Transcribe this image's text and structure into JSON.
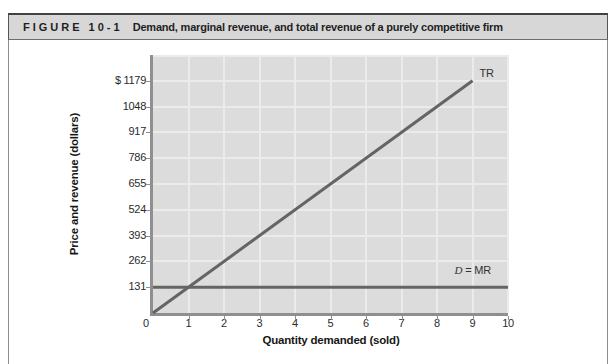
{
  "figure": {
    "label": "FIGURE 10-1",
    "title": "Demand, marginal revenue, and total revenue of a purely competitive firm"
  },
  "chart_data": {
    "type": "line",
    "title": "",
    "xlabel": "Quantity demanded (sold)",
    "ylabel": "Price and revenue (dollars)",
    "xlim": [
      0,
      10
    ],
    "ylim": [
      0,
      1310
    ],
    "grid": true,
    "plot_bg": "#dcdcdc",
    "x_ticks": [
      0,
      1,
      2,
      3,
      4,
      5,
      6,
      7,
      8,
      9,
      10
    ],
    "x_tick_labels": [
      "0",
      "1",
      "2",
      "3",
      "4",
      "5",
      "6",
      "7",
      "8",
      "9",
      "10"
    ],
    "y_ticks": [
      0,
      131,
      262,
      393,
      524,
      655,
      786,
      917,
      1048,
      1179
    ],
    "y_tick_labels": [
      "0",
      "131",
      "262",
      "393",
      "524",
      "655",
      "786",
      "917",
      "1048",
      "$ 1179"
    ],
    "series": [
      {
        "name": "TR",
        "points": [
          [
            0,
            0
          ],
          [
            9,
            1179
          ]
        ],
        "color": "#646464",
        "label_parts": [
          {
            "text": "TR",
            "italic": false
          }
        ],
        "label_anchor": "line-end"
      },
      {
        "name": "D = MR",
        "points": [
          [
            0,
            131
          ],
          [
            10,
            131
          ]
        ],
        "color": "#646464",
        "label_parts": [
          {
            "text": "D",
            "italic": true
          },
          {
            "text": " = MR",
            "italic": false
          }
        ],
        "label_anchor": "above-right"
      }
    ]
  },
  "colors": {
    "header_bg": "#d7d7d7",
    "header_border": "#414141",
    "figure_border": "#8e8e8e",
    "plot_bg": "#dcdcdc",
    "gridline": "#ebebeb",
    "axis": "#8f8f8f",
    "line": "#646464",
    "text": "#1f1f1f"
  }
}
